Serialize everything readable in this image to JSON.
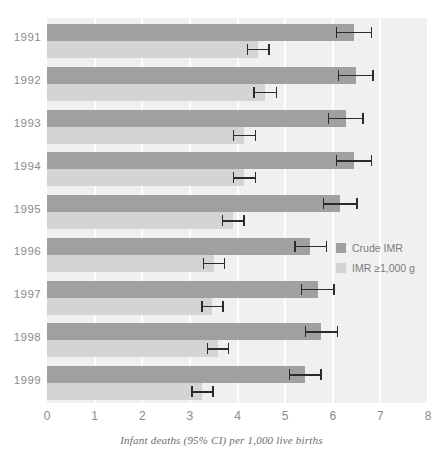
{
  "chart_data": {
    "type": "bar",
    "orientation": "horizontal",
    "title": "",
    "xlabel": "Infant deaths (95% CI) per 1,000 live births",
    "ylabel": "",
    "xlim": [
      0,
      8
    ],
    "xticks": [
      "0",
      "1",
      "2",
      "3",
      "4",
      "5",
      "6",
      "7",
      "8"
    ],
    "grid": true,
    "grid_axis": "x",
    "legend_position": "right-middle",
    "categories": [
      "1991",
      "1992",
      "1993",
      "1994",
      "1995",
      "1996",
      "1997",
      "1998",
      "1999"
    ],
    "series": [
      {
        "name": "Crude IMR",
        "color": "#a0a0a0",
        "values": [
          6.45,
          6.48,
          6.27,
          6.45,
          6.15,
          5.53,
          5.68,
          5.76,
          5.42
        ],
        "ci_low": [
          6.07,
          6.1,
          5.9,
          6.07,
          5.79,
          5.19,
          5.33,
          5.41,
          5.08
        ],
        "ci_high": [
          6.83,
          6.86,
          6.65,
          6.83,
          6.52,
          5.88,
          6.04,
          6.12,
          5.77
        ]
      },
      {
        "name": "IMR ≥1,000 g",
        "color": "#d4d4d4",
        "values": [
          4.43,
          4.58,
          4.14,
          4.14,
          3.91,
          3.5,
          3.47,
          3.59,
          3.26
        ],
        "ci_low": [
          4.19,
          4.33,
          3.9,
          3.9,
          3.67,
          3.27,
          3.24,
          3.35,
          3.03
        ],
        "ci_high": [
          4.68,
          4.83,
          4.39,
          4.39,
          4.15,
          3.74,
          3.71,
          3.83,
          3.5
        ]
      }
    ]
  },
  "legend": {
    "items": [
      {
        "label": "Crude IMR",
        "color": "#a0a0a0"
      },
      {
        "label": "IMR ≥1,000 g",
        "color": "#d4d4d4"
      }
    ]
  },
  "axis": {
    "x_title": "Infant deaths (95% CI) per 1,000 live births"
  }
}
